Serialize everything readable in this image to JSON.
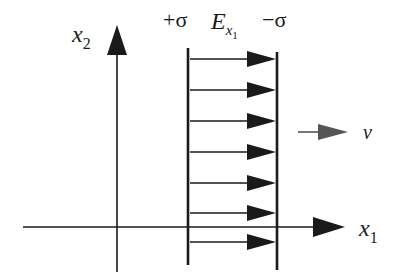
{
  "diagram": {
    "type": "physics-field-diagram",
    "axes": {
      "x1": {
        "label": "x",
        "subscript": "1"
      },
      "x2": {
        "label": "x",
        "subscript": "2"
      }
    },
    "plates": {
      "left": {
        "charge_label": "+σ"
      },
      "right": {
        "charge_label": "−σ"
      }
    },
    "field": {
      "label": "E",
      "subscript": "x",
      "sub_subscript": "1",
      "arrow_count": 7
    },
    "velocity": {
      "label": "v"
    },
    "colors": {
      "ink": "#1a1a1a",
      "velocity_arrow": "#555555",
      "background": "#ffffff"
    }
  }
}
